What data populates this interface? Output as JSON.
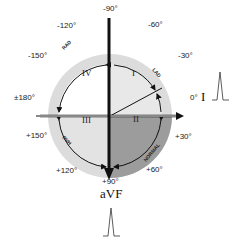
{
  "diagram": {
    "title": "",
    "angle_labels": {
      "top": "-90°",
      "top_left_1": "-120°",
      "top_left_2": "-150°",
      "top_right_1": "-60°",
      "top_right_2": "-30°",
      "left": "±180°",
      "right": "0°",
      "bottom_left_1": "+150°",
      "bottom_left_2": "+120°",
      "bottom_right_1": "+30°",
      "bottom_right_2": "+60°",
      "bottom": "+90°"
    },
    "quadrants": {
      "q1": "I",
      "q2": "II",
      "q3": "III",
      "q4": "IV"
    },
    "arc_labels": {
      "upper_left": "RAD",
      "upper_right": "LAD",
      "lower_left": "RVH",
      "lower_right": "NORMAL"
    },
    "leads": {
      "horizontal": "I",
      "vertical": "aVF"
    },
    "colors": {
      "ring": "#d9d9d9",
      "light_fill": "#e6e6e6",
      "dark_fill": "#9a9a9a",
      "axis": "#111111"
    }
  }
}
